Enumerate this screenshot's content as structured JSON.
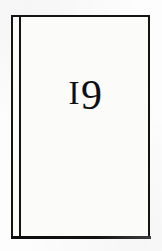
{
  "page": {
    "kind": "scanned-book-plate",
    "background_color": "#fdfdfd",
    "plate_background_color": "#fbfbfa",
    "rule_color": "#141414"
  },
  "plate": {
    "number_label": "19",
    "numeral_one": "I",
    "numeral_nine": "9",
    "has_double_left_rule": true,
    "border_style": "solid rectangular rule"
  }
}
